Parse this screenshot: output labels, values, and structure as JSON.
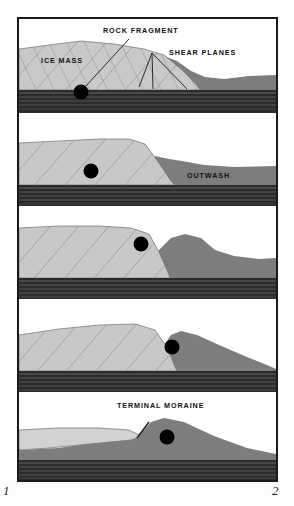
{
  "figure": {
    "corner_label_left": "1",
    "corner_label_right": "2",
    "frame_color": "#1a1a1a",
    "palette": {
      "sky": "#ffffff",
      "ice": "#c9c9c9",
      "ice_hatch": "#8f8f8f",
      "outwash": "#7d7d7d",
      "bedrock": "#2b2b2b",
      "bedrock_striation": "#6a6a6a",
      "rock_fragment": "#000000",
      "label_text": "#111111",
      "leader_line": "#1a1a1a"
    }
  },
  "panels": [
    {
      "index": 1,
      "name": "panel-stage-1",
      "labels": [
        {
          "id": "rock-fragment",
          "text": "ROCK FRAGMENT",
          "x": 84,
          "y": 14,
          "anchor": "start",
          "size": 7.2,
          "color": "dark"
        },
        {
          "id": "shear-planes",
          "text": "SHEAR PLANES",
          "x": 150,
          "y": 36,
          "anchor": "start",
          "size": 7.2,
          "color": "dark"
        },
        {
          "id": "ice-mass",
          "text": "ICE MASS",
          "x": 22,
          "y": 44,
          "anchor": "start",
          "size": 7.2,
          "color": "dark"
        }
      ],
      "rock_fragment": {
        "cx": 62,
        "cy": 73,
        "r": 7.5
      },
      "has_shear_planes": true,
      "has_leader_line": true
    },
    {
      "index": 2,
      "name": "panel-stage-2",
      "labels": [
        {
          "id": "outwash",
          "text": "OUTWASH",
          "x": 168,
          "y": 65,
          "anchor": "start",
          "size": 7.2,
          "color": "dark"
        }
      ],
      "rock_fragment": {
        "cx": 72,
        "cy": 58,
        "r": 7.5
      },
      "has_shear_planes": false,
      "has_leader_line": false
    },
    {
      "index": 3,
      "name": "panel-stage-3",
      "labels": [],
      "rock_fragment": {
        "cx": 122,
        "cy": 38,
        "r": 7.5
      },
      "has_shear_planes": false,
      "has_leader_line": false
    },
    {
      "index": 4,
      "name": "panel-stage-4",
      "labels": [],
      "rock_fragment": {
        "cx": 153,
        "cy": 48,
        "r": 7.5
      },
      "has_shear_planes": false,
      "has_leader_line": false
    },
    {
      "index": 5,
      "name": "panel-stage-5",
      "labels": [
        {
          "id": "terminal-moraine",
          "text": "TERMINAL MORAINE",
          "x": 98,
          "y": 16,
          "anchor": "start",
          "size": 7.2,
          "color": "dark"
        }
      ],
      "rock_fragment": {
        "cx": 148,
        "cy": 45,
        "r": 7.5
      },
      "has_shear_planes": false,
      "has_leader_line": false
    }
  ]
}
